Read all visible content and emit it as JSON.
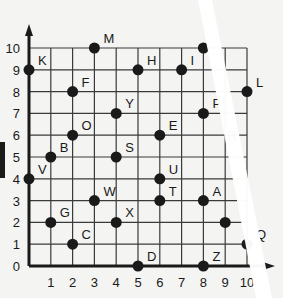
{
  "chart_data": {
    "type": "scatter",
    "title": "",
    "xlabel": "",
    "ylabel": "",
    "xlim": [
      0,
      10
    ],
    "ylim": [
      0,
      10
    ],
    "grid": true,
    "x_ticks": [
      "1",
      "2",
      "3",
      "4",
      "5",
      "6",
      "7",
      "8",
      "9",
      "10"
    ],
    "y_ticks": [
      "0",
      "1",
      "2",
      "3",
      "4",
      "5",
      "6",
      "7",
      "8",
      "9",
      "10"
    ],
    "points": [
      {
        "label": "K",
        "x": 0,
        "y": 9
      },
      {
        "label": "M",
        "x": 3,
        "y": 10
      },
      {
        "label": "F",
        "x": 2,
        "y": 8
      },
      {
        "label": "Y",
        "x": 4,
        "y": 7
      },
      {
        "label": "O",
        "x": 2,
        "y": 6
      },
      {
        "label": "B",
        "x": 1,
        "y": 5
      },
      {
        "label": "S",
        "x": 4,
        "y": 5
      },
      {
        "label": "V",
        "x": 0,
        "y": 4
      },
      {
        "label": "W",
        "x": 3,
        "y": 3
      },
      {
        "label": "G",
        "x": 1,
        "y": 2
      },
      {
        "label": "X",
        "x": 4,
        "y": 2
      },
      {
        "label": "C",
        "x": 2,
        "y": 1
      },
      {
        "label": "D",
        "x": 5,
        "y": 0
      },
      {
        "label": "H",
        "x": 5,
        "y": 9
      },
      {
        "label": "I",
        "x": 7,
        "y": 9
      },
      {
        "label": "",
        "x": 8,
        "y": 10
      },
      {
        "label": "L",
        "x": 10,
        "y": 8
      },
      {
        "label": "P",
        "x": 8,
        "y": 7
      },
      {
        "label": "E",
        "x": 6,
        "y": 6
      },
      {
        "label": "U",
        "x": 6,
        "y": 4
      },
      {
        "label": "T",
        "x": 6,
        "y": 3
      },
      {
        "label": "A",
        "x": 8,
        "y": 3
      },
      {
        "label": "",
        "x": 9,
        "y": 2
      },
      {
        "label": "Q",
        "x": 10,
        "y": 1
      },
      {
        "label": "Z",
        "x": 8,
        "y": 0
      }
    ],
    "extra_labels": [
      {
        "label": "R",
        "x": 9,
        "y": 6
      }
    ]
  },
  "colors": {
    "ink": "#1a1a1a",
    "grid": "#3a3a3a",
    "paper": "#f4f4f2",
    "strip": "#ffffff"
  }
}
